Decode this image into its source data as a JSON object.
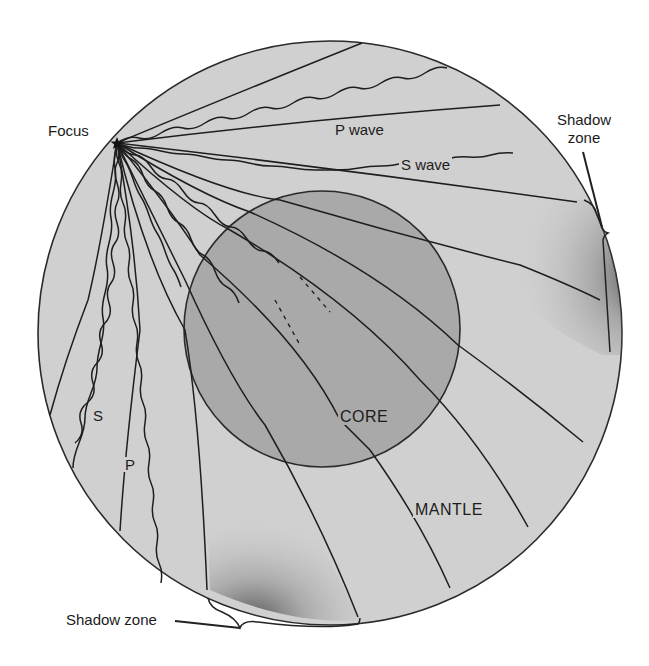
{
  "figure": {
    "type": "earth-seismic-wave-diagram",
    "colors": {
      "background": "#ffffff",
      "mantle": "#d0d0d0",
      "core": "#a9a9a9",
      "outline": "#2a2a2a",
      "shadow_stipple": "#3a3a3a"
    }
  },
  "labels": {
    "focus": "Focus",
    "p_wave": "P wave",
    "s_wave": "S wave",
    "shadow_zone_right_line1": "Shadow",
    "shadow_zone_right_line2": "zone",
    "shadow_zone_bottom": "Shadow zone",
    "s_short": "S",
    "p_short": "P",
    "core": "CORE",
    "mantle": "MANTLE"
  },
  "geometry": {
    "earth": {
      "cx": 330,
      "cy": 333,
      "r": 292
    },
    "core": {
      "cx": 322,
      "cy": 329,
      "r": 138
    },
    "focus": {
      "x": 117,
      "y": 143
    }
  }
}
